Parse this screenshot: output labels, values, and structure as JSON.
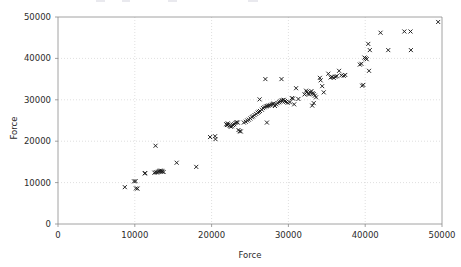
{
  "figure": {
    "width": 461,
    "height": 267,
    "background": "#ffffff",
    "marker_color": "#1a1a1a",
    "grid_color": "#c9c9c9",
    "axis_color": "#8a8a8a",
    "text_color": "#2b2b2b"
  },
  "chart_data": {
    "type": "scatter",
    "title": "",
    "xlabel": "Force",
    "ylabel": "Force",
    "xlim": [
      0,
      50000
    ],
    "ylim": [
      0,
      50000
    ],
    "xticks": [
      0,
      10000,
      20000,
      30000,
      40000,
      50000
    ],
    "yticks": [
      0,
      10000,
      20000,
      30000,
      40000,
      50000
    ],
    "xticklabels": [
      "0",
      "10000",
      "20000",
      "30000",
      "40000",
      "50000"
    ],
    "yticklabels": [
      "0",
      "10000",
      "20000",
      "30000",
      "40000",
      "50000"
    ],
    "grid": true,
    "grid_style": "dotted",
    "legend": null,
    "marker": "x",
    "marker_size": 4,
    "series": [
      {
        "name": "Force vs Force",
        "points": [
          [
            8700,
            8900
          ],
          [
            9900,
            10300
          ],
          [
            10100,
            10350
          ],
          [
            10150,
            8600
          ],
          [
            10350,
            8550
          ],
          [
            11300,
            12200
          ],
          [
            11350,
            12300
          ],
          [
            12700,
            18900
          ],
          [
            12550,
            12400
          ],
          [
            12750,
            12500
          ],
          [
            12900,
            12450
          ],
          [
            13050,
            12600
          ],
          [
            13150,
            12750
          ],
          [
            13300,
            12900
          ],
          [
            13400,
            12700
          ],
          [
            13500,
            12850
          ],
          [
            13600,
            12650
          ],
          [
            13750,
            12550
          ],
          [
            15450,
            14800
          ],
          [
            18000,
            13800
          ],
          [
            19800,
            21000
          ],
          [
            20450,
            21200
          ],
          [
            20500,
            20500
          ],
          [
            21900,
            24100
          ],
          [
            22000,
            23900
          ],
          [
            22100,
            24300
          ],
          [
            22200,
            24000
          ],
          [
            22350,
            23700
          ],
          [
            22500,
            23500
          ],
          [
            22650,
            23600
          ],
          [
            22800,
            23900
          ],
          [
            22950,
            24100
          ],
          [
            23100,
            24400
          ],
          [
            23250,
            24600
          ],
          [
            23400,
            24500
          ],
          [
            23500,
            22700
          ],
          [
            23650,
            22400
          ],
          [
            23800,
            22350
          ],
          [
            24200,
            24500
          ],
          [
            24450,
            24700
          ],
          [
            24650,
            25000
          ],
          [
            24850,
            25200
          ],
          [
            25050,
            25500
          ],
          [
            25250,
            25800
          ],
          [
            25400,
            26000
          ],
          [
            25600,
            26300
          ],
          [
            25800,
            26600
          ],
          [
            26000,
            26900
          ],
          [
            26150,
            27100
          ],
          [
            26300,
            27300
          ],
          [
            26250,
            30100
          ],
          [
            26550,
            27600
          ],
          [
            26700,
            28000
          ],
          [
            26900,
            28200
          ],
          [
            27100,
            28400
          ],
          [
            27250,
            28500
          ],
          [
            27400,
            28600
          ],
          [
            27200,
            24500
          ],
          [
            27000,
            35000
          ],
          [
            27600,
            28700
          ],
          [
            27800,
            28800
          ],
          [
            27950,
            29000
          ],
          [
            28100,
            29100
          ],
          [
            28250,
            28500
          ],
          [
            28400,
            28900
          ],
          [
            28600,
            29200
          ],
          [
            28800,
            29400
          ],
          [
            28950,
            29600
          ],
          [
            29100,
            29800
          ],
          [
            29250,
            29900
          ],
          [
            29400,
            30000
          ],
          [
            29550,
            29700
          ],
          [
            29700,
            29500
          ],
          [
            29900,
            29300
          ],
          [
            29100,
            35000
          ],
          [
            30200,
            29400
          ],
          [
            30450,
            30400
          ],
          [
            30600,
            30300
          ],
          [
            30750,
            28900
          ],
          [
            31000,
            32800
          ],
          [
            31300,
            30200
          ],
          [
            32100,
            31300
          ],
          [
            32300,
            32200
          ],
          [
            32400,
            31900
          ],
          [
            32550,
            31500
          ],
          [
            32700,
            31300
          ],
          [
            32850,
            31800
          ],
          [
            33000,
            32100
          ],
          [
            33150,
            31600
          ],
          [
            33300,
            31400
          ],
          [
            33450,
            31000
          ],
          [
            33600,
            30600
          ],
          [
            33100,
            28600
          ],
          [
            33300,
            29200
          ],
          [
            34100,
            35300
          ],
          [
            34200,
            34700
          ],
          [
            34400,
            33300
          ],
          [
            34600,
            31800
          ],
          [
            35200,
            36300
          ],
          [
            35500,
            35400
          ],
          [
            35700,
            35500
          ],
          [
            35900,
            35300
          ],
          [
            36100,
            35600
          ],
          [
            36300,
            35700
          ],
          [
            36600,
            37000
          ],
          [
            36900,
            35900
          ],
          [
            37200,
            35800
          ],
          [
            37400,
            36000
          ],
          [
            39300,
            38500
          ],
          [
            39500,
            38700
          ],
          [
            39600,
            33400
          ],
          [
            39750,
            33600
          ],
          [
            39900,
            40200
          ],
          [
            40050,
            40000
          ],
          [
            40200,
            39800
          ],
          [
            40400,
            43500
          ],
          [
            40600,
            42000
          ],
          [
            40500,
            37000
          ],
          [
            42000,
            46200
          ],
          [
            43000,
            42000
          ],
          [
            45100,
            46500
          ],
          [
            45900,
            46500
          ],
          [
            45950,
            42000
          ],
          [
            49500,
            48800
          ]
        ]
      }
    ]
  },
  "axes": {
    "x_axis_label": "Force",
    "y_axis_label": "Force"
  }
}
